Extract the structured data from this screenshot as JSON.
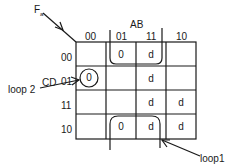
{
  "map": {
    "function_label": "F",
    "function_subscript": "a",
    "col_variable": "AB",
    "row_variable": "CD",
    "col_headers": [
      "00",
      "01",
      "11",
      "10"
    ],
    "row_headers": [
      "00",
      "01",
      "11",
      "10"
    ],
    "cells": [
      [
        "",
        "0",
        "d",
        ""
      ],
      [
        "0",
        "",
        "d",
        ""
      ],
      [
        "",
        "",
        "d",
        "d"
      ],
      [
        "",
        "0",
        "d",
        "d"
      ]
    ]
  },
  "annotations": {
    "loop1": "loop1",
    "loop2": "loop 2"
  },
  "colors": {
    "ink": "#1a1a1a",
    "background": "#ffffff"
  }
}
